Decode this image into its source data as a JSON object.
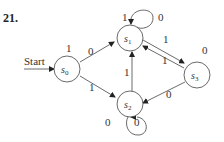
{
  "problem_number": "21.",
  "start_label": "Start",
  "states": [
    {
      "id": "s0",
      "name": "s",
      "sub": "0"
    },
    {
      "id": "s1",
      "name": "s",
      "sub": "1"
    },
    {
      "id": "s2",
      "name": "s",
      "sub": "2"
    },
    {
      "id": "s3",
      "name": "s",
      "sub": "3"
    }
  ],
  "transitions": [
    {
      "from": "s0",
      "to": "s0",
      "label": "1",
      "note": "output label above s0"
    },
    {
      "from": "s0",
      "to": "s1",
      "label": "0"
    },
    {
      "from": "s0",
      "to": "s2",
      "label": "1"
    },
    {
      "from": "s1",
      "to": "s1",
      "label_in": "1",
      "label_out": "0"
    },
    {
      "from": "s1",
      "to": "s3",
      "label": "1"
    },
    {
      "from": "s3",
      "to": "s1",
      "label": "1"
    },
    {
      "from": "s3",
      "to": "s3",
      "label": "0"
    },
    {
      "from": "s2",
      "to": "s1",
      "label": "1"
    },
    {
      "from": "s3",
      "to": "s2",
      "label": "0"
    },
    {
      "from": "s2",
      "to": "s2",
      "label_in": "0",
      "label_out": "0"
    }
  ],
  "labels": {
    "s0_top": "1",
    "s0_s1": "0",
    "s0_s2": "1",
    "s1_loop_left": "1",
    "s1_loop_right": "0",
    "s1_s3": "1",
    "s3_s1": "1",
    "s3_top": "0",
    "s2_s1": "1",
    "s3_s2": "0",
    "s2_loop_left": "0",
    "s2_loop_right": "0"
  }
}
